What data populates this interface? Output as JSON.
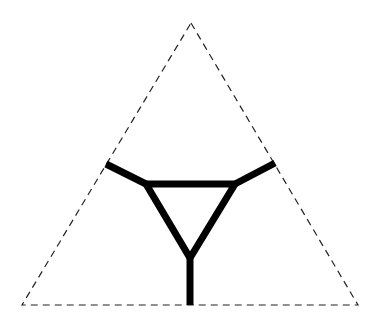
{
  "diagram": {
    "width": 382,
    "height": 322,
    "background": "#ffffff",
    "outer_triangle": {
      "style": "dashed",
      "stroke": "#222222",
      "stroke_width": 1.2,
      "dasharray": "7 5",
      "points": {
        "apex": [
          191,
          23
        ],
        "bottom_left": [
          22,
          305
        ],
        "bottom_right": [
          358,
          305
        ]
      }
    },
    "inner_network": {
      "stroke": "#000000",
      "stroke_width": 7,
      "inner_triangle": {
        "top_left": [
          146,
          184
        ],
        "top_right": [
          235,
          184
        ],
        "bottom": [
          190,
          258
        ]
      },
      "spokes": [
        {
          "name": "left-spoke",
          "from": [
            146,
            184
          ],
          "to": [
            106,
            164
          ]
        },
        {
          "name": "right-spoke",
          "from": [
            235,
            184
          ],
          "to": [
            275,
            163
          ]
        },
        {
          "name": "bottom-spoke",
          "from": [
            190,
            258
          ],
          "to": [
            190,
            305
          ]
        }
      ]
    }
  }
}
